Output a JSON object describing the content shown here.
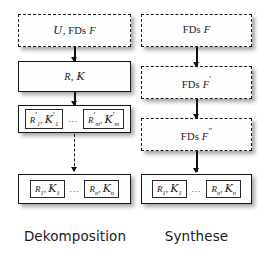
{
  "diagram": {
    "columns": [
      {
        "id": "dekomposition",
        "caption": "Dekomposition",
        "nodes": [
          {
            "id": "dek-node-1",
            "style": "dashed",
            "text": "𝒰, FDs F",
            "parts": {
              "script": "𝒰",
              "sep": ", ",
              "fds": "FDs",
              "var": "F"
            }
          },
          {
            "id": "dek-node-2",
            "style": "solid",
            "text": "R, 𝒦",
            "parts": {
              "rel": "R",
              "sep": ", ",
              "keys": "𝒦"
            }
          },
          {
            "id": "dek-node-3",
            "style": "group",
            "text": "R′₁, 𝒦′₁ ⋯ R′ₘ, 𝒦′ₘ",
            "cells": [
              {
                "rel": "R",
                "rel_sub": "1",
                "rel_prime": "′",
                "keys": "𝒦",
                "keys_sub": "1",
                "keys_prime": "′"
              },
              {
                "rel": "R",
                "rel_sub": "m",
                "rel_prime": "′",
                "keys": "𝒦",
                "keys_sub": "m",
                "keys_prime": "′"
              }
            ],
            "ellipsis": "..."
          },
          {
            "id": "dek-node-4",
            "style": "group",
            "text": "R₁, 𝒦₁ ⋯ Rₙ, 𝒦ₙ",
            "cells": [
              {
                "rel": "R",
                "rel_sub": "1",
                "rel_prime": "",
                "keys": "𝒦",
                "keys_sub": "1",
                "keys_prime": ""
              },
              {
                "rel": "R",
                "rel_sub": "n",
                "rel_prime": "",
                "keys": "𝒦",
                "keys_sub": "n",
                "keys_prime": ""
              }
            ],
            "ellipsis": "..."
          }
        ],
        "arrows": [
          {
            "id": "dek-arrow-1",
            "style": "solid"
          },
          {
            "id": "dek-arrow-2",
            "style": "solid"
          },
          {
            "id": "dek-arrow-3",
            "style": "dashed"
          }
        ]
      },
      {
        "id": "synthese",
        "caption": "Synthese",
        "nodes": [
          {
            "id": "syn-node-1",
            "style": "dashed",
            "text": "FDs F",
            "parts": {
              "fds": "FDs",
              "var": "F",
              "prime": ""
            }
          },
          {
            "id": "syn-node-2",
            "style": "dashed",
            "text": "FDs F′",
            "parts": {
              "fds": "FDs",
              "var": "F",
              "prime": "′"
            }
          },
          {
            "id": "syn-node-3",
            "style": "dashed",
            "text": "FDs F″",
            "parts": {
              "fds": "FDs",
              "var": "F",
              "prime": "″"
            }
          },
          {
            "id": "syn-node-4",
            "style": "group",
            "text": "R₁, 𝒦₁ ⋯ Rₙ, 𝒦ₙ",
            "cells": [
              {
                "rel": "R",
                "rel_sub": "1",
                "rel_prime": "",
                "keys": "𝒦",
                "keys_sub": "1",
                "keys_prime": ""
              },
              {
                "rel": "R",
                "rel_sub": "n",
                "rel_prime": "",
                "keys": "𝒦",
                "keys_sub": "n",
                "keys_prime": ""
              }
            ],
            "ellipsis": "..."
          }
        ],
        "arrows": [
          {
            "id": "syn-arrow-1",
            "style": "solid"
          },
          {
            "id": "syn-arrow-2",
            "style": "solid"
          },
          {
            "id": "syn-arrow-3",
            "style": "solid"
          }
        ]
      }
    ]
  },
  "colors": {
    "stroke": "#161616",
    "fill": "#fdfdfd",
    "background": "#ffffff",
    "shadow": "#3c3c3c"
  }
}
